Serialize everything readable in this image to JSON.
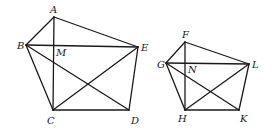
{
  "figures": [
    {
      "name": "pentagon-ABCDE",
      "vertices": {
        "A": {
          "x": 54,
          "y": 17
        },
        "B": {
          "x": 26,
          "y": 45
        },
        "C": {
          "x": 53,
          "y": 110
        },
        "D": {
          "x": 129,
          "y": 110
        },
        "E": {
          "x": 138,
          "y": 47
        }
      },
      "edges": [
        [
          "A",
          "B"
        ],
        [
          "B",
          "C"
        ],
        [
          "C",
          "D"
        ],
        [
          "D",
          "E"
        ],
        [
          "E",
          "A"
        ],
        [
          "A",
          "C"
        ],
        [
          "B",
          "E"
        ],
        [
          "B",
          "D"
        ],
        [
          "C",
          "E"
        ]
      ],
      "labels": [
        {
          "text": "A",
          "x": 50,
          "y": 13
        },
        {
          "text": "B",
          "x": 17,
          "y": 49
        },
        {
          "text": "M",
          "x": 56,
          "y": 56
        },
        {
          "text": "E",
          "x": 141,
          "y": 51
        },
        {
          "text": "C",
          "x": 47,
          "y": 124
        },
        {
          "text": "D",
          "x": 131,
          "y": 124
        }
      ]
    },
    {
      "name": "pentagon-FGHKL",
      "vertices": {
        "F": {
          "x": 185,
          "y": 42
        },
        "G": {
          "x": 166,
          "y": 63
        },
        "H": {
          "x": 185,
          "y": 110
        },
        "K": {
          "x": 239,
          "y": 110
        },
        "L": {
          "x": 249,
          "y": 64
        }
      },
      "edges": [
        [
          "F",
          "G"
        ],
        [
          "G",
          "H"
        ],
        [
          "H",
          "K"
        ],
        [
          "K",
          "L"
        ],
        [
          "L",
          "F"
        ],
        [
          "F",
          "H"
        ],
        [
          "G",
          "L"
        ],
        [
          "G",
          "K"
        ],
        [
          "H",
          "L"
        ]
      ],
      "labels": [
        {
          "text": "F",
          "x": 182,
          "y": 38
        },
        {
          "text": "G",
          "x": 157,
          "y": 68
        },
        {
          "text": "N",
          "x": 188,
          "y": 73
        },
        {
          "text": "L",
          "x": 252,
          "y": 68
        },
        {
          "text": "H",
          "x": 178,
          "y": 122
        },
        {
          "text": "K",
          "x": 240,
          "y": 122
        }
      ]
    }
  ]
}
